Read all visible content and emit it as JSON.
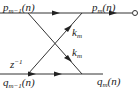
{
  "diagram": {
    "type": "lattice filter stage",
    "inputs": {
      "top": {
        "base": "p",
        "sub": "m−1",
        "arg": "(n)"
      },
      "bottom": {
        "base": "q",
        "sub": "m−1",
        "arg": "(n)"
      }
    },
    "outputs": {
      "top": {
        "base": "p",
        "sub": "m",
        "arg": "(n)"
      },
      "bottom": {
        "base": "q",
        "sub": "m",
        "arg": "(n)"
      }
    },
    "delay": {
      "base": "z",
      "sup": "−1"
    },
    "coefficients": [
      {
        "base": "k",
        "sub": "m"
      },
      {
        "base": "k",
        "sub": "m"
      }
    ],
    "line_color": "#333333"
  }
}
